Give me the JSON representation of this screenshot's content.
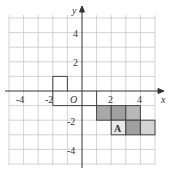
{
  "axes": {
    "x_label": "x",
    "y_label": "y",
    "origin_label": "O",
    "x_ticks": [
      "-4",
      "-2",
      "2",
      "4"
    ],
    "y_ticks": [
      "4",
      "2",
      "-2",
      "-4"
    ]
  },
  "shape_label": "A",
  "colors": {
    "grid": "#c8c8c8",
    "axis": "#333333",
    "shade_dark": "#a8a8a8",
    "shade_light": "#d4d4d4"
  }
}
